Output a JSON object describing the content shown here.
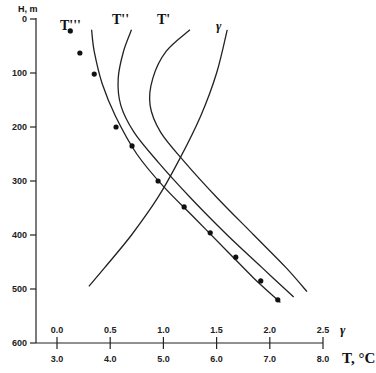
{
  "chart_data": {
    "type": "line",
    "title": "",
    "ylabel": "H, m",
    "xlabel": "T, °C",
    "x2label": "γ",
    "ylim": [
      600,
      0
    ],
    "y_inverted": true,
    "xlim_T": [
      3.0,
      8.0
    ],
    "xlim_gamma": [
      0.0,
      2.5
    ],
    "grid": false,
    "legend": "inline curve labels at top",
    "y_ticks": [
      "0",
      "100",
      "200",
      "300",
      "400",
      "500",
      "600"
    ],
    "x_ticks_T": [
      "3.0",
      "4.0",
      "5.0",
      "6.0",
      "7.0",
      "8.0"
    ],
    "x_ticks_gamma": [
      "0.0",
      "0.5",
      "1.0",
      "1.5",
      "2.0",
      "2.5"
    ],
    "series": [
      {
        "name": "T'''",
        "axis": "T",
        "style": "line",
        "points": [
          [
            3.65,
            20
          ],
          [
            3.7,
            60
          ],
          [
            3.85,
            120
          ],
          [
            4.1,
            180
          ],
          [
            4.5,
            250
          ],
          [
            5.0,
            310
          ],
          [
            5.6,
            370
          ],
          [
            6.2,
            430
          ],
          [
            6.7,
            480
          ],
          [
            7.2,
            525
          ]
        ]
      },
      {
        "name": "T''",
        "axis": "T",
        "style": "line",
        "points": [
          [
            4.4,
            20
          ],
          [
            4.25,
            60
          ],
          [
            4.15,
            110
          ],
          [
            4.2,
            160
          ],
          [
            4.45,
            210
          ],
          [
            4.9,
            265
          ],
          [
            5.5,
            330
          ],
          [
            6.2,
            400
          ],
          [
            6.85,
            460
          ],
          [
            7.45,
            515
          ]
        ]
      },
      {
        "name": "T'",
        "axis": "T",
        "style": "line",
        "points": [
          [
            5.5,
            20
          ],
          [
            5.05,
            60
          ],
          [
            4.8,
            110
          ],
          [
            4.75,
            160
          ],
          [
            4.95,
            210
          ],
          [
            5.4,
            265
          ],
          [
            6.0,
            330
          ],
          [
            6.7,
            400
          ],
          [
            7.3,
            460
          ],
          [
            7.7,
            505
          ]
        ]
      },
      {
        "name": "γ",
        "axis": "gamma",
        "style": "line",
        "points": [
          [
            1.6,
            20
          ],
          [
            1.5,
            100
          ],
          [
            1.35,
            180
          ],
          [
            1.15,
            260
          ],
          [
            0.95,
            330
          ],
          [
            0.7,
            400
          ],
          [
            0.45,
            460
          ],
          [
            0.3,
            495
          ]
        ]
      },
      {
        "name": "observed",
        "axis": "T",
        "style": "markers",
        "points": [
          [
            3.25,
            22
          ],
          [
            3.43,
            63
          ],
          [
            3.7,
            102
          ],
          [
            4.11,
            200
          ],
          [
            4.41,
            235
          ],
          [
            4.9,
            300
          ],
          [
            5.39,
            348
          ],
          [
            5.88,
            396
          ],
          [
            6.36,
            441
          ],
          [
            6.83,
            485
          ],
          [
            7.15,
            520
          ]
        ]
      }
    ],
    "annotations": [
      "T'''",
      "T''",
      "T'",
      "γ"
    ]
  }
}
